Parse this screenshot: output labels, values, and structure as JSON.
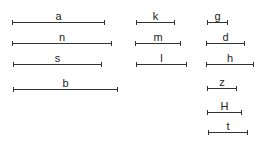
{
  "diagram": {
    "line_color": "#333333",
    "bars": [
      {
        "label": "a",
        "x1": 12,
        "x2": 104,
        "y": 22
      },
      {
        "label": "n",
        "x1": 12,
        "x2": 111,
        "y": 43
      },
      {
        "label": "s",
        "x1": 13,
        "x2": 101,
        "y": 64
      },
      {
        "label": "b",
        "x1": 13,
        "x2": 117,
        "y": 89
      },
      {
        "label": "k",
        "x1": 136,
        "x2": 174,
        "y": 22
      },
      {
        "label": "m",
        "x1": 135,
        "x2": 180,
        "y": 43
      },
      {
        "label": "l",
        "x1": 136,
        "x2": 186,
        "y": 64
      },
      {
        "label": "g",
        "x1": 207,
        "x2": 227,
        "y": 22
      },
      {
        "label": "d",
        "x1": 206,
        "x2": 244,
        "y": 43
      },
      {
        "label": "h",
        "x1": 206,
        "x2": 253,
        "y": 64
      },
      {
        "label": "z",
        "x1": 207,
        "x2": 236,
        "y": 88
      },
      {
        "label": "H",
        "x1": 207,
        "x2": 241,
        "y": 112
      },
      {
        "label": "t",
        "x1": 208,
        "x2": 247,
        "y": 132
      }
    ]
  }
}
